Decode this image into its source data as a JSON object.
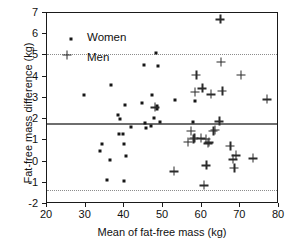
{
  "chart_data": {
    "type": "scatter",
    "title": "",
    "xlabel": "Mean of fat-free mass (kg)",
    "ylabel": "Fat-free mass difference (kg)",
    "xlim": [
      20,
      80
    ],
    "ylim": [
      -2,
      7
    ],
    "xticks": [
      20,
      30,
      40,
      50,
      60,
      70,
      80
    ],
    "yticks": [
      -2,
      -1,
      0,
      1,
      2,
      3,
      4,
      5,
      6,
      7
    ],
    "grid": false,
    "legend_position": "top-left",
    "reference_lines": [
      {
        "name": "mean-difference",
        "value": 1.82,
        "style": "solid",
        "color": "#6e6e6e"
      },
      {
        "name": "upper-limit-of-agreement",
        "value": 5.05,
        "style": "dotted",
        "color": "#8c8c8c"
      },
      {
        "name": "lower-limit-of-agreement",
        "value": -1.35,
        "style": "dotted",
        "color": "#8c8c8c"
      }
    ],
    "series": [
      {
        "name": "Women",
        "marker": "dot",
        "color": "#161616",
        "points": [
          [
            29.5,
            3.12
          ],
          [
            33.6,
            0.52
          ],
          [
            34.1,
            0.84
          ],
          [
            35.6,
            -0.87
          ],
          [
            36.4,
            0.06
          ],
          [
            36.6,
            3.62
          ],
          [
            38.4,
            2.2
          ],
          [
            38.6,
            1.32
          ],
          [
            38.9,
            2.0
          ],
          [
            39.7,
            1.28
          ],
          [
            39.9,
            -0.9
          ],
          [
            40.0,
            0.84
          ],
          [
            40.1,
            2.68
          ],
          [
            40.4,
            0.24
          ],
          [
            41.6,
            1.64
          ],
          [
            44.6,
            2.76
          ],
          [
            45.1,
            4.54
          ],
          [
            45.4,
            1.82
          ],
          [
            45.6,
            1.56
          ],
          [
            46.8,
            1.66
          ],
          [
            47.2,
            3.12
          ],
          [
            47.8,
            2.06
          ],
          [
            48.1,
            5.1
          ],
          [
            48.4,
            2.62
          ],
          [
            48.5,
            2.5
          ],
          [
            48.7,
            4.48
          ],
          [
            49.2,
            1.88
          ],
          [
            53.2,
            2.88
          ],
          [
            57.8,
            1.86
          ],
          [
            58.2,
            2.84
          ]
        ]
      },
      {
        "name": "Men",
        "marker": "plus",
        "color": "#2b2b2b",
        "points": [
          [
            47.9,
            2.56
          ],
          [
            52.8,
            -0.46
          ],
          [
            56.4,
            0.92
          ],
          [
            57.2,
            1.46
          ],
          [
            57.8,
            1.08
          ],
          [
            58.1,
            1.12
          ],
          [
            58.3,
            3.3
          ],
          [
            58.6,
            4.08
          ],
          [
            59.8,
            1.1
          ],
          [
            60.2,
            3.46
          ],
          [
            60.6,
            -1.12
          ],
          [
            61.0,
            1.08
          ],
          [
            61.2,
            -0.18
          ],
          [
            61.6,
            0.86
          ],
          [
            61.9,
            0.9
          ],
          [
            62.4,
            3.16
          ],
          [
            63.0,
            1.44
          ],
          [
            63.4,
            1.5
          ],
          [
            64.6,
            1.9
          ],
          [
            64.8,
            6.7
          ],
          [
            65.0,
            4.7
          ],
          [
            65.3,
            3.34
          ],
          [
            67.4,
            0.74
          ],
          [
            68.1,
            0.1
          ],
          [
            68.4,
            -0.3
          ],
          [
            68.8,
            0.3
          ],
          [
            70.1,
            4.1
          ],
          [
            73.2,
            0.16
          ],
          [
            76.9,
            2.94
          ]
        ]
      }
    ],
    "legend": [
      {
        "label": "Women",
        "marker": "dot"
      },
      {
        "label": "Men",
        "marker": "plus"
      }
    ]
  }
}
